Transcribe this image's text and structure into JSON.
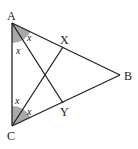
{
  "diagram": {
    "title": "",
    "points": {
      "A": {
        "label": "A",
        "x": 12,
        "y": 23
      },
      "B": {
        "label": "B",
        "x": 120,
        "y": 75
      },
      "C": {
        "label": "C",
        "x": 12,
        "y": 126
      },
      "X": {
        "label": "X",
        "x": 63,
        "y": 47
      },
      "Y": {
        "label": "Y",
        "x": 63,
        "y": 103
      }
    },
    "segments": [
      "AB",
      "BC",
      "CA",
      "AY",
      "CX"
    ],
    "angle_labels": {
      "A_upper": "x",
      "A_lower": "x",
      "C_upper": "x",
      "C_lower": "x"
    },
    "colors": {
      "line": "#222222",
      "shade": "#a9a9a9"
    }
  }
}
